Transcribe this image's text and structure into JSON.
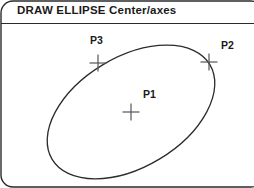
{
  "panel": {
    "title": "DRAW ELLIPSE Center/axes",
    "border_color": "#2b2b2b",
    "divider_color": "#2b2b2b",
    "background": "#ffffff"
  },
  "figure": {
    "type": "ellipse-construction-diagram",
    "ink_color": "#2b2b2b",
    "marker_color": "#555555",
    "ellipse": {
      "center_x": 131,
      "center_y": 112,
      "semi_major": 92,
      "semi_minor": 55,
      "rotation_deg": -31
    },
    "markers": [
      {
        "id": "p1",
        "label": "P1",
        "role": "center",
        "x": 131,
        "y": 112,
        "size": 17
      },
      {
        "id": "p2",
        "label": "P2",
        "role": "axis-endpoint",
        "x": 209,
        "y": 62,
        "size": 17
      },
      {
        "id": "p3",
        "label": "P3",
        "role": "axis-endpoint",
        "x": 98,
        "y": 63,
        "size": 17
      }
    ]
  }
}
